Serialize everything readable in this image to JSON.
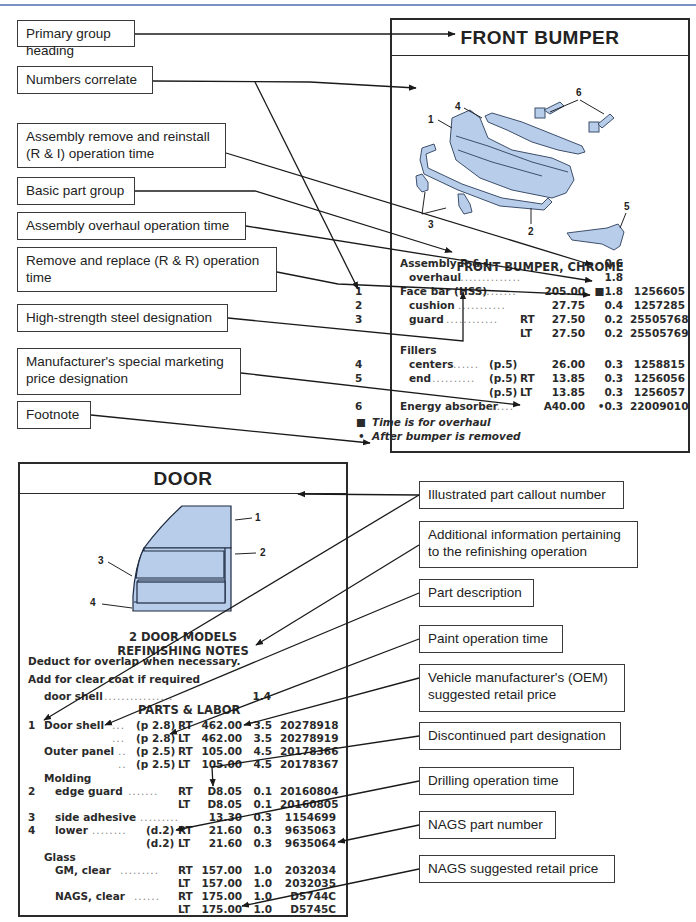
{
  "page_header": {
    "text": ""
  },
  "front_bumper": {
    "heading": "FRONT BUMPER",
    "illustration_callouts": [
      "1",
      "2",
      "3",
      "4",
      "5",
      "6"
    ],
    "section_title": "FRONT BUMPER, CHROME",
    "rows": [
      {
        "num": "",
        "desc": "Assembly R & I",
        "ref": "",
        "side": "",
        "price": "",
        "time": "0.6",
        "part": ""
      },
      {
        "num": "",
        "desc": "overhaul",
        "ref": "",
        "side": "",
        "price": "",
        "time": "1.8",
        "part": ""
      },
      {
        "num": "1",
        "desc": "Face bar (HSS)",
        "ref": "",
        "side": "",
        "price": "205.00",
        "time": "■1.8",
        "part": "1256605"
      },
      {
        "num": "2",
        "desc": "cushion",
        "ref": "",
        "side": "",
        "price": "27.75",
        "time": "0.4",
        "part": "1257285"
      },
      {
        "num": "3",
        "desc": "guard",
        "ref": "",
        "side": "RT",
        "price": "27.50",
        "time": "0.2",
        "part": "25505768"
      },
      {
        "num": "",
        "desc": "",
        "ref": "",
        "side": "LT",
        "price": "27.50",
        "time": "0.2",
        "part": "25505769"
      },
      {
        "num": "",
        "desc": "Fillers",
        "ref": "",
        "side": "",
        "price": "",
        "time": "",
        "part": ""
      },
      {
        "num": "4",
        "desc": "centers",
        "ref": "(p.5)",
        "side": "",
        "price": "26.00",
        "time": "0.3",
        "part": "1258815"
      },
      {
        "num": "5",
        "desc": "end",
        "ref": "(p.5)",
        "side": "RT",
        "price": "13.85",
        "time": "0.3",
        "part": "1256056"
      },
      {
        "num": "",
        "desc": "",
        "ref": "(p.5)",
        "side": "LT",
        "price": "13.85",
        "time": "0.3",
        "part": "1256057"
      },
      {
        "num": "6",
        "desc": "Energy absorber",
        "ref": "",
        "side": "",
        "price": "A40.00",
        "time": "•0.3",
        "part": "22009010"
      }
    ],
    "footnotes": [
      {
        "mark": "■",
        "text": "Time is for overhaul"
      },
      {
        "mark": "•",
        "text": "After bumper is removed"
      }
    ]
  },
  "door": {
    "heading": "DOOR",
    "illustration_callouts": [
      "1",
      "2",
      "3",
      "4"
    ],
    "subtitle_1": "2 DOOR MODELS",
    "subtitle_2": "REFINISHING NOTES",
    "notes": [
      "Deduct for overlap when necessary.",
      "Add for clear coat if required"
    ],
    "refinish_row": {
      "desc": "door shell",
      "time": "1.4"
    },
    "parts_title": "PARTS & LABOR",
    "rows": [
      {
        "num": "1",
        "desc": "Door shell",
        "ref": "(p 2.8)",
        "side": "RT",
        "price": "462.00",
        "time": "3.5",
        "part": "20278918"
      },
      {
        "num": "",
        "desc": "",
        "ref": "(p 2.8)",
        "side": "LT",
        "price": "462.00",
        "time": "3.5",
        "part": "20278919"
      },
      {
        "num": "",
        "desc": "Outer panel",
        "ref": "(p 2.5)",
        "side": "RT",
        "price": "105.00",
        "time": "4.5",
        "part": "20178366"
      },
      {
        "num": "",
        "desc": "",
        "ref": "(p 2.5)",
        "side": "LT",
        "price": "105.00",
        "time": "4.5",
        "part": "20178367"
      },
      {
        "num": "",
        "desc": "Molding",
        "ref": "",
        "side": "",
        "price": "",
        "time": "",
        "part": ""
      },
      {
        "num": "2",
        "desc": "edge guard",
        "ref": "",
        "side": "RT",
        "price": "D8.05",
        "time": "0.1",
        "part": "20160804"
      },
      {
        "num": "",
        "desc": "",
        "ref": "",
        "side": "LT",
        "price": "D8.05",
        "time": "0.1",
        "part": "20160805"
      },
      {
        "num": "3",
        "desc": "side adhesive",
        "ref": "",
        "side": "",
        "price": "13.30",
        "time": "0.3",
        "part": "1154699"
      },
      {
        "num": "4",
        "desc": "lower",
        "ref": "(d.2)",
        "side": "RT",
        "price": "21.60",
        "time": "0.3",
        "part": "9635063"
      },
      {
        "num": "",
        "desc": "",
        "ref": "(d.2)",
        "side": "LT",
        "price": "21.60",
        "time": "0.3",
        "part": "9635064"
      },
      {
        "num": "",
        "desc": "Glass",
        "ref": "",
        "side": "",
        "price": "",
        "time": "",
        "part": ""
      },
      {
        "num": "",
        "desc": "GM, clear",
        "ref": "",
        "side": "RT",
        "price": "157.00",
        "time": "1.0",
        "part": "2032034"
      },
      {
        "num": "",
        "desc": "",
        "ref": "",
        "side": "LT",
        "price": "157.00",
        "time": "1.0",
        "part": "2032035"
      },
      {
        "num": "",
        "desc": "NAGS, clear",
        "ref": "",
        "side": "RT",
        "price": "175.00",
        "time": "1.0",
        "part": "D5744C"
      },
      {
        "num": "",
        "desc": "",
        "ref": "",
        "side": "LT",
        "price": "175.00",
        "time": "1.0",
        "part": "D5745C"
      }
    ]
  },
  "left_callouts": [
    "Primary group heading",
    "Numbers correlate",
    "Assembly remove and reinstall (R & I) operation time",
    "Basic part group",
    "Assembly overhaul operation time",
    "Remove and replace (R & R) operation time",
    "High-strength steel designation",
    "Manufacturer's special marketing price designation",
    "Footnote"
  ],
  "right_callouts": [
    "Illustrated part callout number",
    "Additional information pertaining to the refinishing operation",
    "Part description",
    "Paint operation time",
    "Vehicle manufacturer's (OEM) suggested retail price",
    "Discontinued part designation",
    "Drilling operation time",
    "NAGS part number",
    "NAGS suggested retail price"
  ],
  "colors": {
    "illustration_fill": "#b7cdea",
    "border": "#2a2a2a",
    "top_rule": "#7a93c4"
  }
}
